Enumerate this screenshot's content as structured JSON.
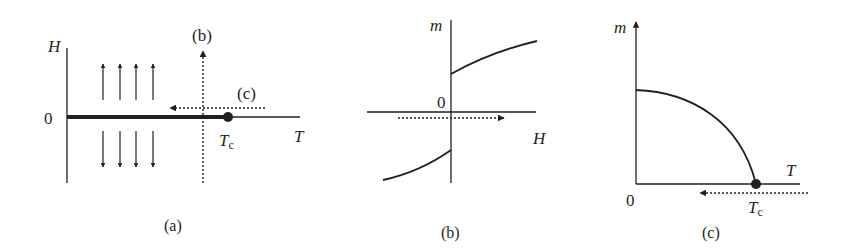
{
  "figure": {
    "panels": [
      {
        "id": "a",
        "caption": "(a)",
        "axis_labels": {
          "y": "H",
          "x": "T",
          "origin": "0"
        },
        "critical_point": {
          "label": "T",
          "subscript": "c"
        },
        "path_labels": {
          "vertical": "(b)",
          "horizontal": "(c)"
        },
        "description": "H-T phase diagram: first-order line along H=0 ending at critical point Tc; spins up above, down below; dotted paths (b) vertical and (c) horizontal"
      },
      {
        "id": "b",
        "caption": "(b)",
        "axis_labels": {
          "y": "m",
          "x": "H",
          "origin": "0"
        },
        "description": "Magnetization m vs field H with discontinuous jump at H=0; dotted arrow along H direction"
      },
      {
        "id": "c",
        "caption": "(c)",
        "axis_labels": {
          "y": "m",
          "x": "T",
          "origin": "0"
        },
        "critical_point": {
          "label": "T",
          "subscript": "c"
        },
        "description": "Spontaneous magnetization m vs T decreasing to zero at Tc; dotted arrow pointing toward lower T"
      }
    ]
  },
  "colors": {
    "ink": "#231f20",
    "background": "#ffffff"
  }
}
